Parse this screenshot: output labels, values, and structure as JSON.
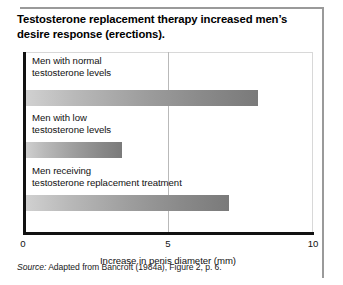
{
  "figure": {
    "title": "Testosterone replacement therapy increased men’s desire response (erections).",
    "source_word": "Source:",
    "source_text": " Adapted from Bancroft (1984a), Figure 2, p. 6."
  },
  "chart_data": {
    "type": "bar",
    "orientation": "horizontal",
    "title": "Testosterone replacement therapy increased men’s desire response (erections).",
    "xlabel": "Increase in penis diameter (mm)",
    "ylabel": "",
    "xlim": [
      0,
      10
    ],
    "xticks": [
      0,
      5,
      10
    ],
    "xtick_labels": [
      "0",
      "5",
      "10"
    ],
    "grid": true,
    "gridlines_x": [
      5
    ],
    "legend": null,
    "categories": [
      "Men with normal\ntestosterone levels",
      "Men with low\ntestosterone levels",
      "Men receiving\ntestosterone replacement treatment"
    ],
    "values": [
      8.1,
      3.4,
      7.1
    ],
    "units": "mm",
    "bar_color_start": "#d2d2d2",
    "bar_color_end": "#7a7a7a",
    "axis_color": "#111111",
    "gridline_color": "#b9b9b9",
    "frame_color": "#9a9a9a",
    "background": "#ffffff"
  },
  "bars": [
    {
      "label": "Men with normal\ntestosterone levels",
      "value": 8.1,
      "label_top": 3,
      "bar_top": 38
    },
    {
      "label": "Men with low\ntestosterone levels",
      "value": 3.4,
      "label_top": 60,
      "bar_top": 90
    },
    {
      "label": "Men receiving\ntestosterone replacement treatment",
      "value": 7.1,
      "label_top": 113,
      "bar_top": 143
    }
  ]
}
